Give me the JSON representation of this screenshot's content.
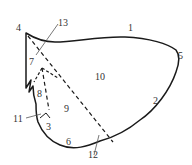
{
  "diagram": {
    "colors": {
      "outline": "#1a1a1a",
      "dashed": "#1a1a1a",
      "leader": "#555555",
      "text": "#333333"
    },
    "labels": {
      "l1": "1",
      "l2": "2",
      "l3": "3",
      "l4": "4",
      "l5": "5",
      "l6": "6",
      "l7": "7",
      "l8": "8",
      "l9": "9",
      "l10": "10",
      "l11": "11",
      "l12": "12",
      "l13": "13"
    }
  }
}
